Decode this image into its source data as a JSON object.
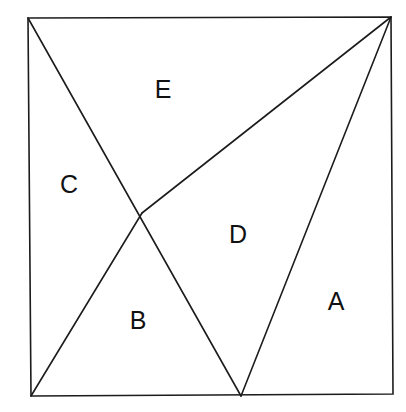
{
  "diagram": {
    "stroke_color": "#1c1c1c",
    "background": "#ffffff",
    "points": {
      "top_left": [
        28,
        18
      ],
      "top_right": [
        391,
        17
      ],
      "bottom_right": [
        393,
        394
      ],
      "bottom_left": [
        31,
        396
      ],
      "bottom_vertex": [
        241,
        396
      ],
      "intersection": [
        142,
        213
      ]
    },
    "regions": [
      {
        "id": "A",
        "label": "A",
        "x": 336,
        "y": 301
      },
      {
        "id": "B",
        "label": "B",
        "x": 138,
        "y": 320
      },
      {
        "id": "C",
        "label": "C",
        "x": 69,
        "y": 184
      },
      {
        "id": "D",
        "label": "D",
        "x": 238,
        "y": 234
      },
      {
        "id": "E",
        "label": "E",
        "x": 163,
        "y": 89
      }
    ]
  }
}
